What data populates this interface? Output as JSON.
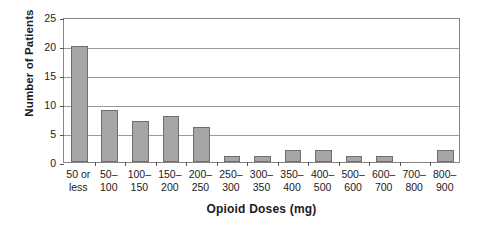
{
  "chart_data": {
    "type": "bar",
    "title": "",
    "xlabel": "Opioid Doses (mg)",
    "ylabel": "Number of Patients",
    "categories": [
      "50 or less",
      "50–100",
      "100–150",
      "150–200",
      "200–250",
      "250–300",
      "300–350",
      "350–400",
      "400–500",
      "500–600",
      "600–700",
      "700–800",
      "800–900"
    ],
    "category_lines": [
      [
        "50 or",
        "less"
      ],
      [
        "50–",
        "100"
      ],
      [
        "100–",
        "150"
      ],
      [
        "150–",
        "200"
      ],
      [
        "200–",
        "250"
      ],
      [
        "250–",
        "300"
      ],
      [
        "300–",
        "350"
      ],
      [
        "350–",
        "400"
      ],
      [
        "400–",
        "500"
      ],
      [
        "500–",
        "600"
      ],
      [
        "600–",
        "700"
      ],
      [
        "700–",
        "800"
      ],
      [
        "800–",
        "900"
      ]
    ],
    "values": [
      20,
      9,
      7,
      8,
      6,
      1,
      1,
      2,
      2,
      1,
      1,
      0,
      2
    ],
    "ylim": [
      0,
      25
    ],
    "yticks": [
      0,
      5,
      10,
      15,
      20,
      25
    ],
    "ytick_labels": [
      "0",
      "5",
      "10",
      "15",
      "20",
      "25"
    ],
    "grid": "horizontal",
    "legend": "none",
    "bar_color": "#a6a6a6",
    "bar_border_color": "#6e6e6e",
    "gridline_color": "#9a9a9a",
    "axis_color": "#868686",
    "text_color": "#1b1b1b"
  }
}
